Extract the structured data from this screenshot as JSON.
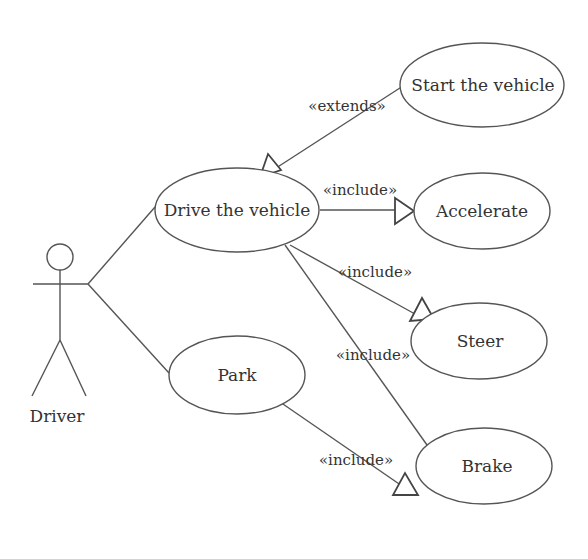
{
  "diagram": {
    "type": "uml-use-case",
    "actor": {
      "name": "Driver"
    },
    "use_cases": [
      {
        "id": "drive",
        "label": "Drive the vehicle"
      },
      {
        "id": "start",
        "label": "Start the vehicle"
      },
      {
        "id": "accelerate",
        "label": "Accelerate"
      },
      {
        "id": "steer",
        "label": "Steer"
      },
      {
        "id": "park",
        "label": "Park"
      },
      {
        "id": "brake",
        "label": "Brake"
      }
    ],
    "relationships": [
      {
        "from": "Driver",
        "to": "drive",
        "type": "association",
        "label": ""
      },
      {
        "from": "Driver",
        "to": "park",
        "type": "association",
        "label": ""
      },
      {
        "from": "start",
        "to": "drive",
        "type": "extend",
        "label": "«extends»"
      },
      {
        "from": "drive",
        "to": "accelerate",
        "type": "include",
        "label": "«include»"
      },
      {
        "from": "drive",
        "to": "steer",
        "type": "include",
        "label": "«include»"
      },
      {
        "from": "drive",
        "to": "brake",
        "type": "include",
        "label": "«include»"
      },
      {
        "from": "park",
        "to": "brake",
        "type": "include",
        "label": "«include»"
      }
    ]
  }
}
